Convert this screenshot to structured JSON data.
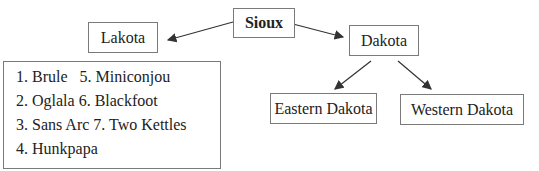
{
  "diagram": {
    "root": {
      "label": "Sioux"
    },
    "branches": [
      {
        "label": "Lakota",
        "subgroups": [
          "1. Brule   5. Miniconjou",
          "2. Oglala 6. Blackfoot",
          "3. Sans Arc 7. Two Kettles",
          "4. Hunkpapa"
        ]
      },
      {
        "label": "Dakota",
        "children": [
          {
            "label": "Eastern Dakota"
          },
          {
            "label": "Western Dakota"
          }
        ]
      }
    ]
  },
  "colors": {
    "box_border": "#7a7a7a",
    "arrow": "#333333",
    "text": "#222222"
  }
}
